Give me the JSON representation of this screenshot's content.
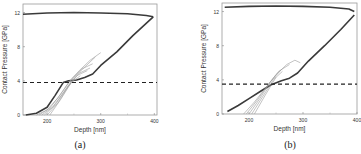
{
  "chart_data": [
    {
      "panel": "(a)",
      "type": "line",
      "xlabel": "Depth [nm]",
      "ylabel": "Contact Pressure [GPa]",
      "xlim": [
        155,
        405
      ],
      "ylim": [
        0,
        13
      ],
      "xticks": [
        200,
        300,
        400
      ],
      "yticks": [
        0,
        4,
        8,
        12
      ],
      "grid": false,
      "threshold_line": {
        "style": "dashed",
        "y": 3.8
      },
      "series": [
        {
          "name": "plateau (top)",
          "x": [
            155,
            200,
            250,
            300,
            350,
            385,
            398
          ],
          "y": [
            11.8,
            11.95,
            12.0,
            11.95,
            11.85,
            11.65,
            11.5
          ]
        },
        {
          "name": "loading (main)",
          "x": [
            160,
            180,
            200,
            215,
            230,
            240,
            255,
            270,
            285,
            300,
            330,
            360,
            398
          ],
          "y": [
            0.0,
            0.2,
            0.9,
            2.3,
            3.8,
            4.0,
            4.1,
            4.4,
            4.8,
            5.8,
            7.4,
            9.3,
            11.5
          ]
        },
        {
          "name": "trace 2",
          "x": [
            180,
            200,
            220,
            240,
            260,
            280,
            300
          ],
          "y": [
            0.0,
            0.6,
            2.0,
            3.8,
            5.2,
            6.4,
            7.3
          ]
        },
        {
          "name": "trace 3",
          "x": [
            185,
            205,
            225,
            245,
            265,
            285
          ],
          "y": [
            0.0,
            0.8,
            2.4,
            4.2,
            5.4,
            6.0
          ]
        },
        {
          "name": "trace 4",
          "x": [
            190,
            210,
            230,
            250,
            270,
            290
          ],
          "y": [
            0.0,
            0.9,
            2.6,
            4.4,
            5.6,
            6.8
          ]
        },
        {
          "name": "trace 5",
          "x": [
            195,
            215,
            235,
            255,
            275
          ],
          "y": [
            0.0,
            1.2,
            3.0,
            4.6,
            5.2
          ]
        },
        {
          "name": "trace 6",
          "x": [
            200,
            220,
            240,
            260,
            280
          ],
          "y": [
            0.0,
            1.4,
            3.4,
            4.9,
            5.5
          ]
        },
        {
          "name": "trace 7",
          "x": [
            205,
            225,
            245,
            262
          ],
          "y": [
            0.0,
            1.8,
            3.8,
            4.6
          ]
        }
      ],
      "caption": "(a)"
    },
    {
      "panel": "(b)",
      "type": "line",
      "xlabel": "Depth [nm]",
      "ylabel": "Contact Pressure [GPa]",
      "xlim": [
        150,
        400
      ],
      "ylim": [
        0,
        13
      ],
      "xticks": [
        200,
        300,
        400
      ],
      "yticks": [
        0,
        4,
        8,
        12
      ],
      "grid": false,
      "threshold_line": {
        "style": "dashed",
        "y": 3.5
      },
      "series": [
        {
          "name": "plateau (top)",
          "x": [
            155,
            200,
            250,
            300,
            350,
            385,
            395
          ],
          "y": [
            12.5,
            12.6,
            12.65,
            12.6,
            12.5,
            12.3,
            12.0
          ]
        },
        {
          "name": "loading (main)",
          "x": [
            160,
            180,
            200,
            220,
            240,
            260,
            275,
            290,
            310,
            340,
            370,
            395
          ],
          "y": [
            0.3,
            1.0,
            1.8,
            2.6,
            3.4,
            3.9,
            4.2,
            4.8,
            6.2,
            8.0,
            9.9,
            11.6
          ]
        },
        {
          "name": "trace 2",
          "x": [
            190,
            210,
            230,
            250,
            270,
            285,
            295
          ],
          "y": [
            0.0,
            1.4,
            3.0,
            4.6,
            5.8,
            6.3,
            6.0
          ]
        },
        {
          "name": "trace 3",
          "x": [
            195,
            215,
            235,
            255,
            275
          ],
          "y": [
            0.0,
            1.6,
            3.4,
            5.0,
            5.8
          ]
        },
        {
          "name": "trace 4",
          "x": [
            200,
            220,
            240,
            260
          ],
          "y": [
            0.0,
            1.8,
            3.8,
            5.2
          ]
        },
        {
          "name": "trace 5",
          "x": [
            205,
            225,
            245,
            262
          ],
          "y": [
            0.0,
            2.0,
            4.0,
            5.0
          ]
        },
        {
          "name": "trace 6",
          "x": [
            210,
            230,
            250
          ],
          "y": [
            0.0,
            2.2,
            4.3
          ]
        }
      ],
      "caption": "(b)"
    }
  ]
}
